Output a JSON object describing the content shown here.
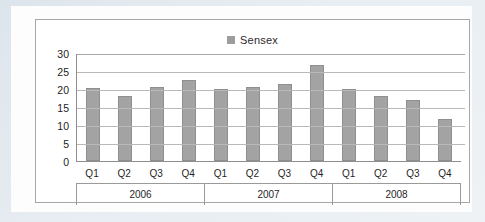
{
  "chart_data": {
    "type": "bar",
    "title": "",
    "legend": [
      {
        "name": "Sensex",
        "color": "#a3a3a3"
      }
    ],
    "legend_position": "top-center",
    "grid": true,
    "xlabel": "",
    "ylabel": "",
    "ylim": [
      0,
      30
    ],
    "yticks": [
      30,
      25,
      20,
      15,
      10,
      5,
      0
    ],
    "categories": [
      "Q1",
      "Q2",
      "Q3",
      "Q4",
      "Q1",
      "Q2",
      "Q3",
      "Q4",
      "Q1",
      "Q2",
      "Q3",
      "Q4"
    ],
    "groups": [
      {
        "label": "2006",
        "span": 4
      },
      {
        "label": "2007",
        "span": 4
      },
      {
        "label": "2008",
        "span": 4
      }
    ],
    "series": [
      {
        "name": "Sensex",
        "color": "#a3a3a3",
        "values": [
          20.2,
          18.0,
          20.6,
          22.5,
          20.0,
          20.5,
          21.5,
          26.7,
          20.0,
          18.0,
          17.0,
          11.8
        ]
      }
    ],
    "points": [
      {
        "group": "2006",
        "category": "Q1",
        "value": 20.2
      },
      {
        "group": "2006",
        "category": "Q2",
        "value": 18.0
      },
      {
        "group": "2006",
        "category": "Q3",
        "value": 20.6
      },
      {
        "group": "2006",
        "category": "Q4",
        "value": 22.5
      },
      {
        "group": "2007",
        "category": "Q1",
        "value": 20.0
      },
      {
        "group": "2007",
        "category": "Q2",
        "value": 20.5
      },
      {
        "group": "2007",
        "category": "Q3",
        "value": 21.5
      },
      {
        "group": "2007",
        "category": "Q4",
        "value": 26.7
      },
      {
        "group": "2008",
        "category": "Q1",
        "value": 20.0
      },
      {
        "group": "2008",
        "category": "Q2",
        "value": 18.0
      },
      {
        "group": "2008",
        "category": "Q3",
        "value": 17.0
      },
      {
        "group": "2008",
        "category": "Q4",
        "value": 11.8
      }
    ]
  },
  "colors": {
    "bar": "#a3a3a3",
    "bar_border": "#8f8f8f",
    "grid": "#b9b9b9",
    "axis": "#8e8e8e",
    "frame": "#a7a7a7",
    "page": "#fdfdfd",
    "scan_margin": "#e2e9ef"
  }
}
